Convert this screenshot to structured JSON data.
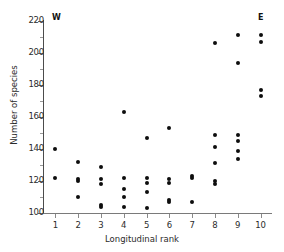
{
  "chart_data": {
    "type": "scatter",
    "title": "",
    "xlabel": "Longitudinal rank",
    "ylabel": "Number of species",
    "xlim": [
      0.5,
      10.5
    ],
    "ylim": [
      100,
      220
    ],
    "xticks": [
      "1",
      "2",
      "3",
      "4",
      "5",
      "6",
      "7",
      "8",
      "9",
      "10"
    ],
    "yticks": [
      "100",
      "120",
      "140",
      "160",
      "180",
      "200",
      "220"
    ],
    "ytick_minor_step": 10,
    "grid": false,
    "legend": null,
    "annotations": [
      {
        "text": "W",
        "position": "top-left"
      },
      {
        "text": "E",
        "position": "top-right"
      }
    ],
    "marker": {
      "shape": "circle",
      "color": "#0d0d0d",
      "size": 4
    },
    "points": [
      {
        "x": 1,
        "y": 140
      },
      {
        "x": 1,
        "y": 122
      },
      {
        "x": 2,
        "y": 132
      },
      {
        "x": 2,
        "y": 121
      },
      {
        "x": 2,
        "y": 120
      },
      {
        "x": 2,
        "y": 110
      },
      {
        "x": 3,
        "y": 129
      },
      {
        "x": 3,
        "y": 121
      },
      {
        "x": 3,
        "y": 118
      },
      {
        "x": 3,
        "y": 105
      },
      {
        "x": 3,
        "y": 104
      },
      {
        "x": 4,
        "y": 163
      },
      {
        "x": 4,
        "y": 122
      },
      {
        "x": 4,
        "y": 115
      },
      {
        "x": 4,
        "y": 110
      },
      {
        "x": 4,
        "y": 104
      },
      {
        "x": 5,
        "y": 147
      },
      {
        "x": 5,
        "y": 122
      },
      {
        "x": 5,
        "y": 119
      },
      {
        "x": 5,
        "y": 113
      },
      {
        "x": 5,
        "y": 103
      },
      {
        "x": 6,
        "y": 153
      },
      {
        "x": 6,
        "y": 121
      },
      {
        "x": 6,
        "y": 119
      },
      {
        "x": 6,
        "y": 108
      },
      {
        "x": 6,
        "y": 107
      },
      {
        "x": 7,
        "y": 123
      },
      {
        "x": 7,
        "y": 122
      },
      {
        "x": 7,
        "y": 107
      },
      {
        "x": 8,
        "y": 206
      },
      {
        "x": 8,
        "y": 149
      },
      {
        "x": 8,
        "y": 141
      },
      {
        "x": 8,
        "y": 131
      },
      {
        "x": 8,
        "y": 120
      },
      {
        "x": 8,
        "y": 118
      },
      {
        "x": 9,
        "y": 211
      },
      {
        "x": 9,
        "y": 194
      },
      {
        "x": 9,
        "y": 149
      },
      {
        "x": 9,
        "y": 145
      },
      {
        "x": 9,
        "y": 139
      },
      {
        "x": 9,
        "y": 134
      },
      {
        "x": 10,
        "y": 211
      },
      {
        "x": 10,
        "y": 207
      },
      {
        "x": 10,
        "y": 177
      },
      {
        "x": 10,
        "y": 173
      }
    ]
  }
}
